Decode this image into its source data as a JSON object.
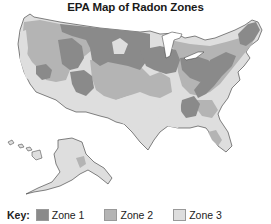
{
  "title": "EPA Map of Radon Zones",
  "key": {
    "label": "Key:",
    "items": [
      {
        "label": "Zone 1",
        "color": "#8a8a8a"
      },
      {
        "label": "Zone 2",
        "color": "#b4b4b4"
      },
      {
        "label": "Zone 3",
        "color": "#dedede"
      }
    ]
  },
  "regions": {
    "contiguous_us": "United States (contiguous)",
    "alaska": "Alaska",
    "hawaii": "Hawaii"
  }
}
